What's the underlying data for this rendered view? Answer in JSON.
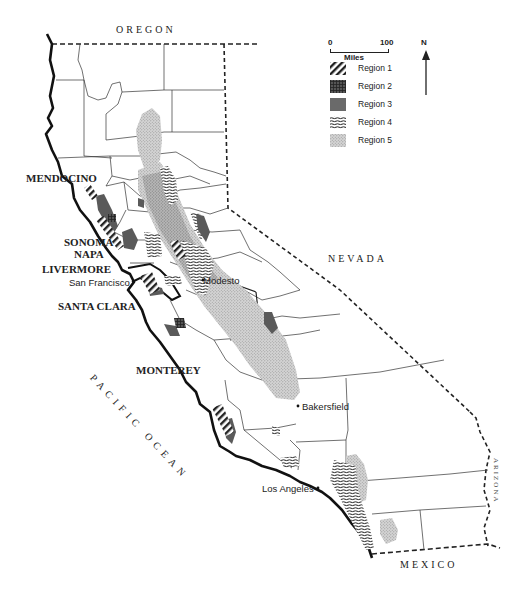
{
  "map": {
    "title": "California wine regions map",
    "neighbors": {
      "north": "OREGON",
      "east": "NEVADA",
      "southeast": "ARIZONA",
      "south": "MEXICO",
      "west": "PACIFIC OCEAN"
    },
    "wine_regions": [
      "MENDOCINO",
      "SONOMA",
      "NAPA",
      "LIVERMORE",
      "SANTA CLARA",
      "MONTEREY"
    ],
    "cities": [
      "San Francisco",
      "Modesto",
      "Bakersfield",
      "Los Angeles"
    ],
    "scale": {
      "start": "0",
      "end": "100",
      "unit": "Miles"
    },
    "north_arrow": "N",
    "legend": [
      {
        "label": "Region 1",
        "pattern": "diagonal-hatch"
      },
      {
        "label": "Region 2",
        "pattern": "dark-crosshatch"
      },
      {
        "label": "Region 3",
        "pattern": "solid-gray"
      },
      {
        "label": "Region 4",
        "pattern": "horizontal-wavy-lines"
      },
      {
        "label": "Region 5",
        "pattern": "light-stipple"
      }
    ],
    "colors": {
      "ink": "#222222",
      "region3": "#6a6a6a",
      "region5": "#c8c8c8",
      "background": "#ffffff"
    }
  }
}
